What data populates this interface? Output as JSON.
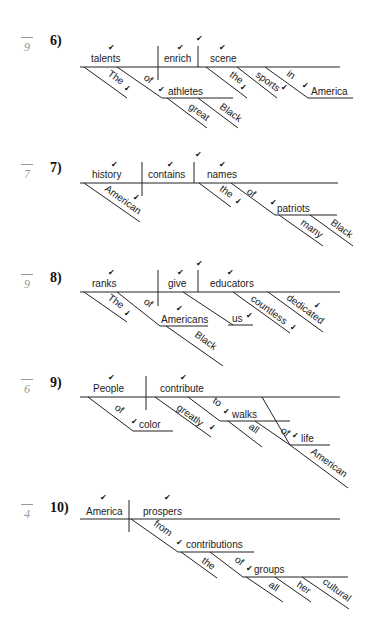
{
  "exercises": [
    {
      "number": "6)",
      "score": "9",
      "top": 33,
      "lines": [
        [
          80,
          67,
          340,
          67
        ],
        [
          158,
          46,
          158,
          80
        ],
        [
          198,
          46,
          198,
          67
        ],
        [
          84,
          67,
          127,
          98
        ],
        [
          117,
          67,
          162,
          98
        ],
        [
          162,
          98,
          233,
          98
        ],
        [
          167,
          98,
          207,
          128
        ],
        [
          198,
          98,
          238,
          128
        ],
        [
          206,
          67,
          247,
          98
        ],
        [
          237,
          67,
          277,
          98
        ],
        [
          265,
          67,
          308,
          98
        ],
        [
          308,
          98,
          353,
          98
        ]
      ],
      "words": [
        {
          "t": "talents",
          "x": 91,
          "y": 62
        },
        {
          "t": "enrich",
          "x": 164,
          "y": 62
        },
        {
          "t": "scene",
          "x": 210,
          "y": 62
        },
        {
          "t": "athletes",
          "x": 168,
          "y": 95
        },
        {
          "t": "America",
          "x": 311,
          "y": 95
        }
      ],
      "slanted": [
        {
          "t": "The",
          "x": 107,
          "y": 75
        },
        {
          "t": "of",
          "x": 143,
          "y": 79
        },
        {
          "t": "great",
          "x": 188,
          "y": 108
        },
        {
          "t": "Black",
          "x": 219,
          "y": 108
        },
        {
          "t": "the",
          "x": 229,
          "y": 76
        },
        {
          "t": "sports",
          "x": 255,
          "y": 76
        },
        {
          "t": "in",
          "x": 286,
          "y": 75
        }
      ],
      "checks": [
        {
          "x": 108,
          "y": 50
        },
        {
          "x": 177,
          "y": 50
        },
        {
          "x": 196,
          "y": 41
        },
        {
          "x": 219,
          "y": 50
        },
        {
          "x": 124,
          "y": 91
        },
        {
          "x": 158,
          "y": 92
        },
        {
          "x": 240,
          "y": 90
        },
        {
          "x": 281,
          "y": 90
        },
        {
          "x": 302,
          "y": 88
        }
      ]
    },
    {
      "number": "7)",
      "score": "7",
      "top": 160,
      "lines": [
        [
          80,
          183,
          338,
          183
        ],
        [
          142,
          162,
          142,
          196
        ],
        [
          194,
          162,
          194,
          183
        ],
        [
          84,
          183,
          140,
          222
        ],
        [
          199,
          183,
          231,
          207
        ],
        [
          231,
          183,
          275,
          215
        ],
        [
          275,
          215,
          337,
          215
        ],
        [
          279,
          215,
          323,
          246
        ],
        [
          310,
          215,
          353,
          246
        ]
      ],
      "words": [
        {
          "t": "history",
          "x": 92,
          "y": 178
        },
        {
          "t": "contains",
          "x": 148,
          "y": 178
        },
        {
          "t": "names",
          "x": 207,
          "y": 178
        },
        {
          "t": "patriots",
          "x": 277,
          "y": 212
        }
      ],
      "slanted": [
        {
          "t": "American",
          "x": 104,
          "y": 190
        },
        {
          "t": "the",
          "x": 219,
          "y": 190
        },
        {
          "t": "of",
          "x": 246,
          "y": 193
        },
        {
          "t": "many",
          "x": 300,
          "y": 224
        },
        {
          "t": "Black",
          "x": 330,
          "y": 224
        }
      ],
      "checks": [
        {
          "x": 111,
          "y": 167
        },
        {
          "x": 167,
          "y": 167
        },
        {
          "x": 195,
          "y": 157
        },
        {
          "x": 219,
          "y": 167
        },
        {
          "x": 133,
          "y": 200
        },
        {
          "x": 235,
          "y": 204
        },
        {
          "x": 270,
          "y": 205
        }
      ]
    },
    {
      "number": "8)",
      "score": "9",
      "top": 270,
      "lines": [
        [
          80,
          292,
          340,
          292
        ],
        [
          158,
          270,
          158,
          306
        ],
        [
          198,
          270,
          198,
          292
        ],
        [
          84,
          292,
          127,
          322
        ],
        [
          117,
          292,
          160,
          326
        ],
        [
          160,
          326,
          208,
          326
        ],
        [
          166,
          326,
          223,
          366
        ],
        [
          183,
          292,
          233,
          325
        ],
        [
          228,
          325,
          253,
          325
        ],
        [
          233,
          292,
          290,
          333
        ],
        [
          268,
          292,
          323,
          332
        ]
      ],
      "words": [
        {
          "t": "ranks",
          "x": 92,
          "y": 287
        },
        {
          "t": "give",
          "x": 168,
          "y": 287
        },
        {
          "t": "educators",
          "x": 210,
          "y": 287
        },
        {
          "t": "Americans",
          "x": 161,
          "y": 323
        },
        {
          "t": "us",
          "x": 232,
          "y": 322
        }
      ],
      "slanted": [
        {
          "t": "The",
          "x": 107,
          "y": 299
        },
        {
          "t": "of",
          "x": 143,
          "y": 303
        },
        {
          "t": "Black",
          "x": 194,
          "y": 336
        },
        {
          "t": "countless",
          "x": 250,
          "y": 300
        },
        {
          "t": "dedicated",
          "x": 286,
          "y": 299
        }
      ],
      "checks": [
        {
          "x": 108,
          "y": 275
        },
        {
          "x": 177,
          "y": 275
        },
        {
          "x": 196,
          "y": 266
        },
        {
          "x": 227,
          "y": 275
        },
        {
          "x": 124,
          "y": 316
        },
        {
          "x": 176,
          "y": 311
        },
        {
          "x": 246,
          "y": 318
        },
        {
          "x": 290,
          "y": 330
        },
        {
          "x": 314,
          "y": 308
        }
      ]
    },
    {
      "number": "9)",
      "score": "6",
      "top": 375,
      "lines": [
        [
          80,
          397,
          340,
          397
        ],
        [
          146,
          376,
          146,
          410
        ],
        [
          88,
          397,
          133,
          431
        ],
        [
          133,
          431,
          173,
          431
        ],
        [
          155,
          397,
          211,
          437
        ],
        [
          188,
          397,
          220,
          421
        ],
        [
          220,
          421,
          290,
          421
        ],
        [
          228,
          421,
          262,
          447
        ],
        [
          262,
          397,
          290,
          445
        ],
        [
          255,
          421,
          290,
          445
        ],
        [
          290,
          445,
          330,
          445
        ],
        [
          290,
          445,
          348,
          488
        ]
      ],
      "words": [
        {
          "t": "People",
          "x": 93,
          "y": 392
        },
        {
          "t": "contribute",
          "x": 160,
          "y": 392
        },
        {
          "t": "color",
          "x": 139,
          "y": 428
        },
        {
          "t": "walks",
          "x": 232,
          "y": 418
        },
        {
          "t": "life",
          "x": 301,
          "y": 442
        }
      ],
      "slanted": [
        {
          "t": "of",
          "x": 114,
          "y": 409
        },
        {
          "t": "greatly",
          "x": 176,
          "y": 409
        },
        {
          "t": "to",
          "x": 212,
          "y": 402
        },
        {
          "t": "all",
          "x": 248,
          "y": 428
        },
        {
          "t": "of",
          "x": 280,
          "y": 432
        },
        {
          "t": "American",
          "x": 310,
          "y": 453
        }
      ],
      "checks": [
        {
          "x": 108,
          "y": 380
        },
        {
          "x": 180,
          "y": 380
        },
        {
          "x": 131,
          "y": 424
        },
        {
          "x": 209,
          "y": 430
        },
        {
          "x": 223,
          "y": 414
        },
        {
          "x": 292,
          "y": 438
        }
      ]
    },
    {
      "number": "10)",
      "score": "4",
      "top": 500,
      "lines": [
        [
          80,
          519,
          340,
          519
        ],
        [
          129,
          500,
          129,
          532
        ],
        [
          131,
          519,
          178,
          552
        ],
        [
          178,
          552,
          254,
          552
        ],
        [
          181,
          552,
          217,
          578
        ],
        [
          210,
          552,
          243,
          577
        ],
        [
          243,
          577,
          348,
          577
        ],
        [
          246,
          577,
          283,
          602
        ],
        [
          275,
          577,
          311,
          602
        ],
        [
          302,
          577,
          349,
          609
        ]
      ],
      "words": [
        {
          "t": "America",
          "x": 86,
          "y": 515
        },
        {
          "t": "prospers",
          "x": 143,
          "y": 515
        },
        {
          "t": "contributions",
          "x": 186,
          "y": 548
        },
        {
          "t": "groups",
          "x": 254,
          "y": 573
        }
      ],
      "slanted": [
        {
          "t": "from",
          "x": 153,
          "y": 525
        },
        {
          "t": "the",
          "x": 201,
          "y": 562
        },
        {
          "t": "of",
          "x": 234,
          "y": 561
        },
        {
          "t": "all",
          "x": 268,
          "y": 586
        },
        {
          "t": "her",
          "x": 296,
          "y": 586
        },
        {
          "t": "cultural",
          "x": 322,
          "y": 583
        }
      ],
      "checks": [
        {
          "x": 100,
          "y": 500
        },
        {
          "x": 164,
          "y": 500
        },
        {
          "x": 176,
          "y": 545
        },
        {
          "x": 246,
          "y": 571
        }
      ]
    }
  ],
  "icons": {
    "check": "✔"
  }
}
